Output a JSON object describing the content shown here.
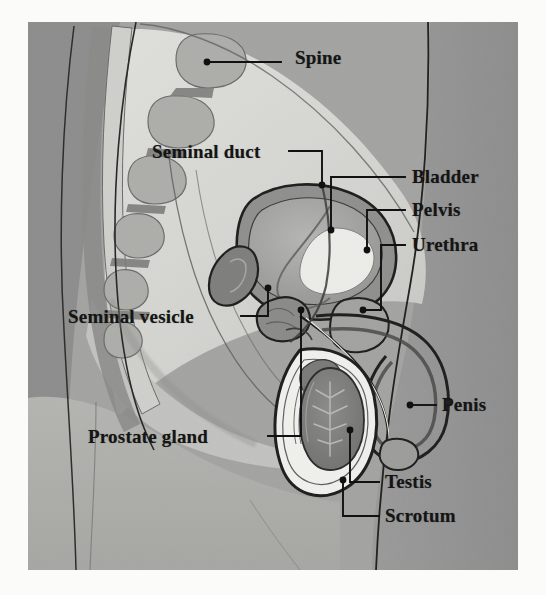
{
  "figure": {
    "style": "grayscale textbook illustration",
    "frame": {
      "x": 28,
      "y": 22,
      "width": 490,
      "height": 548,
      "page_background": "#fbfbfa"
    },
    "palette": {
      "page_background": "#fbfbfa",
      "outer_body_dark": "#8f8f8f",
      "body_mid": "#a8a8a8",
      "body_light": "#c9c9c6",
      "abdomen_pale": "#d8d8d4",
      "organ_white": "#f2f2ee",
      "organ_mid_gray": "#9a9a99",
      "organ_dark_gray": "#7c7c7b",
      "line_black": "#1b1b1b",
      "label_color": "#151515",
      "leader_color": "#111111"
    }
  },
  "labels": [
    {
      "id": "spine",
      "text": "Spine",
      "side": "right",
      "text_x": 295,
      "text_y": 47,
      "font_size": 19,
      "dot": {
        "x": 207,
        "y": 62
      },
      "leader": "M207,62 L281,62"
    },
    {
      "id": "seminal-duct",
      "text": "Seminal duct",
      "side": "left",
      "text_x": 152,
      "text_y": 141,
      "font_size": 19,
      "dot": {
        "x": 322,
        "y": 185
      },
      "leader": "M289,151 L322,151 L322,185"
    },
    {
      "id": "bladder",
      "text": "Bladder",
      "side": "right",
      "text_x": 412,
      "text_y": 166,
      "font_size": 19,
      "dot": {
        "x": 331,
        "y": 230
      },
      "leader": "M405,177 L331,177 L331,230"
    },
    {
      "id": "pelvis",
      "text": "Pelvis",
      "side": "right",
      "text_x": 412,
      "text_y": 199,
      "font_size": 19,
      "dot": {
        "x": 367,
        "y": 250
      },
      "leader": "M405,210 L367,210 L367,250"
    },
    {
      "id": "urethra",
      "text": "Urethra",
      "side": "right",
      "text_x": 412,
      "text_y": 234,
      "font_size": 19,
      "dot": {
        "x": 363,
        "y": 310
      },
      "leader": "M405,245 L381,245 L381,310 L363,310"
    },
    {
      "id": "seminal-vesicle",
      "text": "Seminal vesicle",
      "side": "left",
      "text_x": 68,
      "text_y": 306,
      "font_size": 19,
      "dot": {
        "x": 268,
        "y": 288
      },
      "leader": "M241,316 L268,316 L268,288"
    },
    {
      "id": "prostate-gland",
      "text": "Prostate gland",
      "side": "left",
      "text_x": 88,
      "text_y": 426,
      "font_size": 19,
      "dot": {
        "x": 301,
        "y": 310
      },
      "leader": "M268,436 L301,436 L301,310"
    },
    {
      "id": "penis",
      "text": "Penis",
      "side": "right",
      "text_x": 442,
      "text_y": 394,
      "font_size": 19,
      "dot": {
        "x": 410,
        "y": 405
      },
      "leader": "M410,405 L436,405"
    },
    {
      "id": "testis",
      "text": "Testis",
      "side": "right",
      "text_x": 385,
      "text_y": 471,
      "font_size": 19,
      "dot": {
        "x": 350,
        "y": 430
      },
      "leader": "M379,482 L350,482 L350,430"
    },
    {
      "id": "scrotum",
      "text": "Scrotum",
      "side": "right",
      "text_x": 385,
      "text_y": 505,
      "font_size": 19,
      "dot": {
        "x": 343,
        "y": 480
      },
      "leader": "M379,516 L343,516 L343,480"
    }
  ]
}
